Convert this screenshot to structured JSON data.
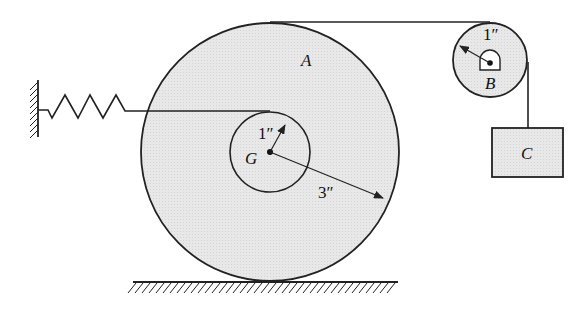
{
  "diagram": {
    "labels": {
      "disk_a": "A",
      "center_g": "G",
      "pulley_b": "B",
      "block_c": "C",
      "inner_radius": "1″",
      "outer_radius": "3″",
      "pulley_radius": "1″"
    },
    "colors": {
      "fill": "#e6e6e6",
      "stroke": "#222222"
    }
  }
}
